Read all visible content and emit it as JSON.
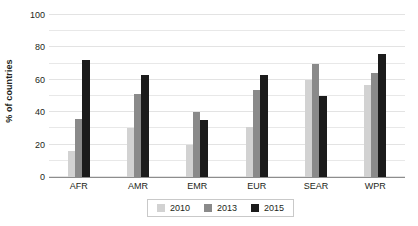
{
  "chart_data": {
    "type": "bar",
    "title": "",
    "xlabel": "",
    "ylabel": "% of countries",
    "categories": [
      "AFR",
      "AMR",
      "EMR",
      "EUR",
      "SEAR",
      "WPR"
    ],
    "series": [
      {
        "name": "2010",
        "color": "#d2d2d2",
        "values": [
          16,
          30,
          20,
          31,
          60,
          57
        ]
      },
      {
        "name": "2013",
        "color": "#8a8a8a",
        "values": [
          36,
          51,
          40,
          54,
          70,
          64
        ]
      },
      {
        "name": "2015",
        "color": "#1b1b1b",
        "values": [
          72,
          63,
          35,
          63,
          50,
          76
        ]
      }
    ],
    "ylim": [
      0,
      100
    ],
    "yticks": [
      0,
      20,
      40,
      60,
      80,
      100
    ],
    "ytick_labels": [
      "0",
      "20",
      "40",
      "60",
      "80",
      "100"
    ],
    "gridlines_every": 10,
    "grid": true,
    "legend_position": "bottom",
    "legend_entries": [
      "2010",
      "2013",
      "2015"
    ]
  }
}
